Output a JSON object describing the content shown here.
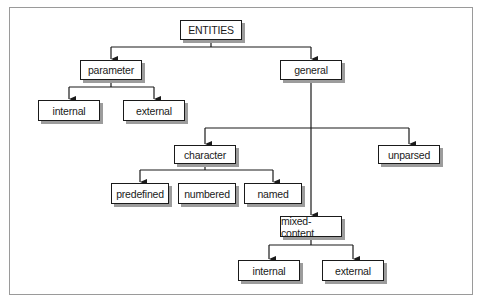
{
  "diagram": {
    "type": "tree",
    "root": "ENTITIES",
    "nodes": {
      "entities": "ENTITIES",
      "parameter": "parameter",
      "general": "general",
      "param_internal": "internal",
      "param_external": "external",
      "character": "character",
      "unparsed": "unparsed",
      "predefined": "predefined",
      "numbered": "numbered",
      "named": "named",
      "mixed_content": "mixed-content",
      "mixed_internal": "internal",
      "mixed_external": "external"
    },
    "edges": [
      [
        "ENTITIES",
        "parameter"
      ],
      [
        "ENTITIES",
        "general"
      ],
      [
        "parameter",
        "internal"
      ],
      [
        "parameter",
        "external"
      ],
      [
        "general",
        "character"
      ],
      [
        "general",
        "unparsed"
      ],
      [
        "general",
        "mixed-content"
      ],
      [
        "character",
        "predefined"
      ],
      [
        "character",
        "numbered"
      ],
      [
        "character",
        "named"
      ],
      [
        "mixed-content",
        "internal"
      ],
      [
        "mixed-content",
        "external"
      ]
    ],
    "colors": {
      "line": "#1a1a1a",
      "shadow": "#9c9c9c",
      "frame": "#9a9a9a",
      "background": "#ffffff"
    }
  }
}
